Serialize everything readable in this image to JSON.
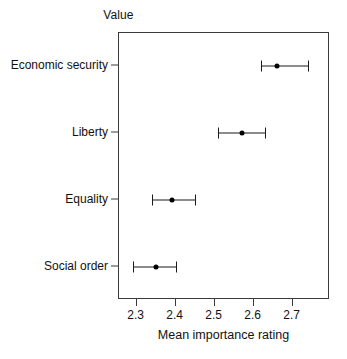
{
  "chart_data": {
    "type": "scatter",
    "title": "Value",
    "xlabel": "Mean importance rating",
    "ylabel": "",
    "orientation": "horizontal",
    "grid": false,
    "legend": null,
    "xlim": [
      2.255,
      2.796
    ],
    "xticks": [
      "2.3",
      "2.4",
      "2.5",
      "2.6",
      "2.7"
    ],
    "xtick_values": [
      2.3,
      2.4,
      2.5,
      2.6,
      2.7
    ],
    "categories": [
      "Economic security",
      "Liberty",
      "Equality",
      "Social order"
    ],
    "values": [
      2.66,
      2.57,
      2.39,
      2.35
    ],
    "error_low": [
      2.62,
      2.51,
      2.34,
      2.29
    ],
    "error_high": [
      2.74,
      2.63,
      2.45,
      2.4
    ],
    "points": [
      {
        "category": "Economic security",
        "mean": 2.66,
        "ci_low": 2.62,
        "ci_high": 2.74
      },
      {
        "category": "Liberty",
        "mean": 2.57,
        "ci_low": 2.51,
        "ci_high": 2.63
      },
      {
        "category": "Equality",
        "mean": 2.39,
        "ci_low": 2.34,
        "ci_high": 2.45
      },
      {
        "category": "Social order",
        "mean": 2.35,
        "ci_low": 2.29,
        "ci_high": 2.4
      }
    ],
    "marker_color": "#000000",
    "errorbar_color": "#1a1a1a",
    "axis_color": "#3a3a3a",
    "background_color": "#ffffff"
  }
}
